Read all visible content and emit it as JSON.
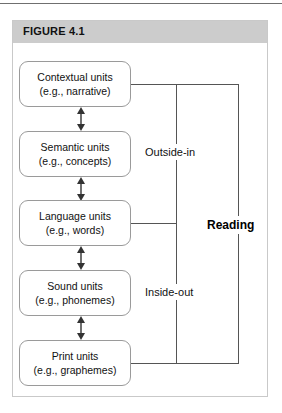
{
  "figure": {
    "header_label": "FIGURE 4.1",
    "top_rule": "horizontal-rule"
  },
  "diagram": {
    "type": "flow-diagram",
    "orientation": "vertical-chain",
    "nodes": [
      {
        "id": "contextual",
        "title": "Contextual units",
        "example": "(e.g., narrative)"
      },
      {
        "id": "semantic",
        "title": "Semantic units",
        "example": "(e.g., concepts)"
      },
      {
        "id": "language",
        "title": "Language units",
        "example": "(e.g., words)"
      },
      {
        "id": "sound",
        "title": "Sound units",
        "example": "(e.g., phonemes)"
      },
      {
        "id": "print",
        "title": "Print units",
        "example": "(e.g., graphemes)"
      }
    ],
    "connectors": [
      {
        "from": "contextual",
        "to": "semantic",
        "style": "double-headed-arrow"
      },
      {
        "from": "semantic",
        "to": "language",
        "style": "double-headed-arrow"
      },
      {
        "from": "language",
        "to": "sound",
        "style": "double-headed-arrow"
      },
      {
        "from": "sound",
        "to": "print",
        "style": "double-headed-arrow"
      }
    ],
    "brackets": [
      {
        "id": "outside-in",
        "label": "Outside-in",
        "spans": [
          "contextual",
          "language"
        ]
      },
      {
        "id": "inside-out",
        "label": "Inside-out",
        "spans": [
          "language",
          "print"
        ]
      },
      {
        "id": "reading",
        "label": "Reading",
        "spans": [
          "contextual",
          "print"
        ],
        "emphasis": "bold"
      }
    ],
    "colors": {
      "header_band": "#cccccc",
      "panel_border": "#c9c9c9",
      "node_border": "#9a9a9a",
      "connector_line": "#555555",
      "text": "#111111",
      "background": "#ffffff"
    }
  }
}
